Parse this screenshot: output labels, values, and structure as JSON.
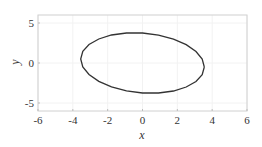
{
  "chart_data": {
    "type": "line",
    "title": "",
    "xlabel": "x",
    "ylabel": "y",
    "xlim": [
      -6,
      6
    ],
    "ylim": [
      -6,
      6
    ],
    "xticks": [
      -6,
      -4,
      -2,
      0,
      2,
      4,
      6
    ],
    "yticks": [
      -5,
      0,
      5
    ],
    "xtick_labels": [
      "-6",
      "-4",
      "-2",
      "0",
      "2",
      "4",
      "6"
    ],
    "ytick_labels": [
      "-5",
      "0",
      "5"
    ],
    "grid": true,
    "legend": null,
    "series": [
      {
        "name": "ellipse",
        "color": "#333333",
        "closed": true,
        "x": [
          3.55,
          3.43,
          3.07,
          2.51,
          1.78,
          0.92,
          0.0,
          -0.92,
          -1.78,
          -2.51,
          -3.07,
          -3.43,
          -3.55,
          -3.43,
          -3.07,
          -2.51,
          -1.78,
          -0.92,
          0.0,
          0.92,
          1.78,
          2.51,
          3.07,
          3.43
        ],
        "y": [
          -0.5,
          0.49,
          1.44,
          2.3,
          2.99,
          3.49,
          3.75,
          3.75,
          3.5,
          3.0,
          2.31,
          1.45,
          0.5,
          -0.49,
          -1.44,
          -2.3,
          -2.99,
          -3.49,
          -3.75,
          -3.75,
          -3.5,
          -3.0,
          -2.31,
          -1.45
        ]
      }
    ]
  }
}
